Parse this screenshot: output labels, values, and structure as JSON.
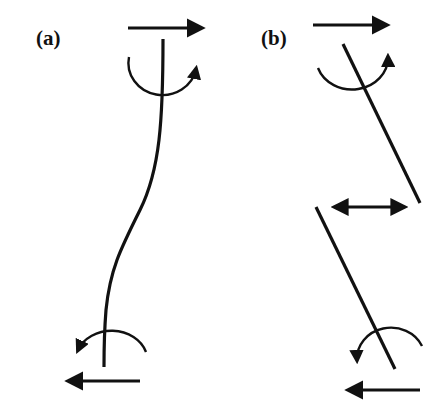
{
  "diagram": {
    "panels": [
      {
        "id": "a",
        "label": "(a)",
        "description": "Flexible column in double curvature with opposing end shears and end moments",
        "elements": [
          "top shear arrow (right)",
          "top moment (clockwise arc)",
          "curved column",
          "bottom moment (arc)",
          "bottom shear arrow (left)"
        ]
      },
      {
        "id": "b",
        "label": "(b)",
        "description": "Column split into two rigid inclined segments with relative lateral displacement",
        "elements": [
          "top shear arrow (right)",
          "top moment (arc)",
          "upper inclined segment",
          "double-headed displacement arrow",
          "lower inclined segment",
          "bottom moment (arc)",
          "bottom shear arrow (left)"
        ]
      }
    ],
    "colors": {
      "stroke": "#111111",
      "background": "#ffffff"
    }
  }
}
